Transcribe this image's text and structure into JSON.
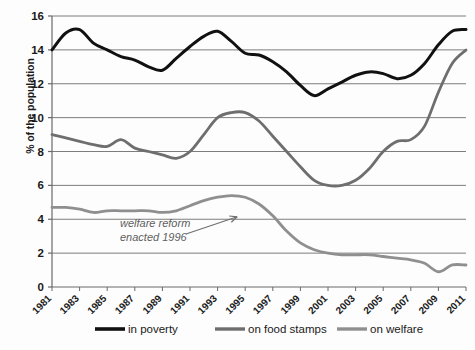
{
  "chart_data": {
    "type": "line",
    "title": "",
    "xlabel": "",
    "ylabel": "% of the population",
    "xlim": [
      1981,
      2011
    ],
    "ylim": [
      0,
      16
    ],
    "ytick_step": 2,
    "grid": true,
    "legend_position": "bottom",
    "x": [
      1981,
      1982,
      1983,
      1984,
      1985,
      1986,
      1987,
      1988,
      1989,
      1990,
      1991,
      1992,
      1993,
      1994,
      1995,
      1996,
      1997,
      1998,
      1999,
      2000,
      2001,
      2002,
      2003,
      2004,
      2005,
      2006,
      2007,
      2008,
      2009,
      2010,
      2011
    ],
    "xtick_labels": [
      "1981",
      "1983",
      "1985",
      "1987",
      "1989",
      "1991",
      "1993",
      "1995",
      "1997",
      "1999",
      "2001",
      "2003",
      "2005",
      "2007",
      "2009",
      "2011"
    ],
    "ytick_labels": [
      "0",
      "2",
      "4",
      "6",
      "8",
      "10",
      "12",
      "14",
      "16"
    ],
    "series": [
      {
        "name": "in poverty",
        "color": "#111111",
        "width": 3.0,
        "values": [
          14.0,
          15.0,
          15.2,
          14.4,
          14.0,
          13.6,
          13.4,
          13.0,
          12.8,
          13.5,
          14.2,
          14.8,
          15.1,
          14.5,
          13.8,
          13.7,
          13.3,
          12.7,
          11.9,
          11.3,
          11.7,
          12.1,
          12.5,
          12.7,
          12.6,
          12.3,
          12.5,
          13.2,
          14.3,
          15.1,
          15.2
        ]
      },
      {
        "name": "on food stamps",
        "color": "#6e6e6e",
        "width": 2.8,
        "values": [
          9.0,
          8.8,
          8.6,
          8.4,
          8.3,
          8.7,
          8.2,
          8.0,
          7.8,
          7.6,
          8.0,
          9.0,
          10.0,
          10.3,
          10.3,
          9.8,
          8.9,
          8.0,
          7.1,
          6.3,
          6.0,
          6.0,
          6.3,
          7.0,
          8.0,
          8.6,
          8.7,
          9.5,
          11.5,
          13.2,
          14.0
        ]
      },
      {
        "name": "on welfare",
        "color": "#8f8f8f",
        "width": 2.8,
        "values": [
          4.7,
          4.7,
          4.6,
          4.4,
          4.5,
          4.5,
          4.5,
          4.5,
          4.4,
          4.5,
          4.8,
          5.1,
          5.3,
          5.4,
          5.3,
          4.9,
          4.2,
          3.3,
          2.6,
          2.2,
          2.0,
          1.9,
          1.9,
          1.9,
          1.8,
          1.7,
          1.6,
          1.4,
          0.9,
          1.3,
          1.3
        ]
      }
    ],
    "annotations": [
      {
        "text_line1": "welfare reform",
        "text_line2": "enacted 1996",
        "target_x": 1995,
        "target_y": 4.5
      }
    ]
  }
}
